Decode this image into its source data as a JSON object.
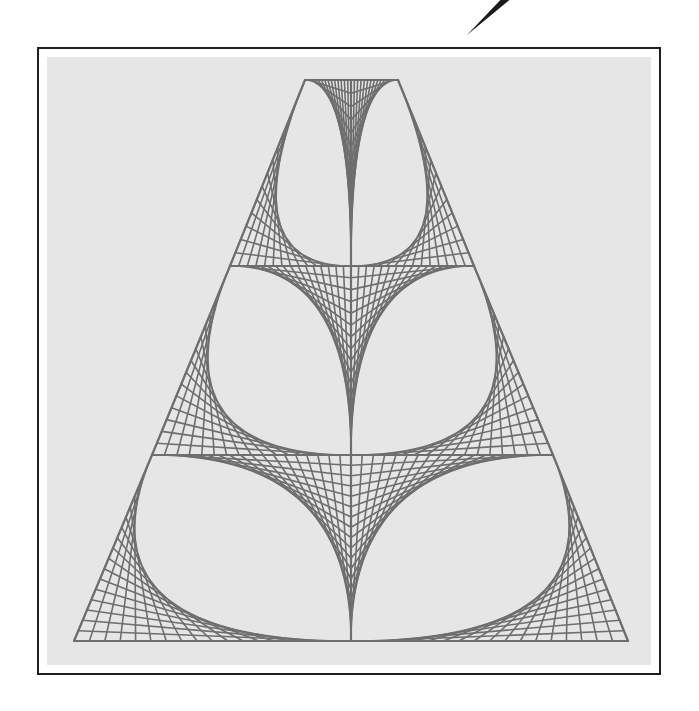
{
  "figure": {
    "canvas": {
      "width": 699,
      "height": 711,
      "background": "#ffffff"
    },
    "frame": {
      "outer": {
        "x": 37,
        "y": 47,
        "width": 624,
        "height": 628,
        "border_color": "#1e1e1e"
      },
      "inner": {
        "x": 47,
        "y": 57,
        "width": 604,
        "height": 608,
        "fill": "#e6e6e6"
      }
    },
    "string_color": "#6e6e6e",
    "string_width": 1.6,
    "outline_width": 2.2,
    "center_x": 351,
    "tiers": [
      {
        "name": "top",
        "top_y": 80,
        "top_left_x": 305,
        "top_right_x": 398,
        "bottom_y": 266,
        "bottom_left_x": 230,
        "bottom_right_x": 474,
        "divisions": 14
      },
      {
        "name": "middle",
        "top_y": 266,
        "top_left_x": 230,
        "top_right_x": 474,
        "bottom_y": 455,
        "bottom_left_x": 152,
        "bottom_right_x": 553,
        "divisions": 16
      },
      {
        "name": "bottom",
        "top_y": 455,
        "top_left_x": 152,
        "top_right_x": 553,
        "bottom_y": 641,
        "bottom_left_x": 74,
        "bottom_right_x": 628,
        "divisions": 18
      }
    ],
    "pen": {
      "tip": [
        467,
        35
      ],
      "end": [
        510,
        -5
      ],
      "color": "#1a1a1a"
    }
  }
}
